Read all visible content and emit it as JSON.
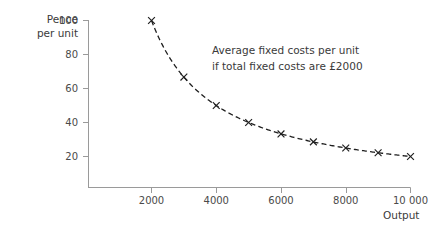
{
  "chart_data": {
    "type": "line",
    "title": "",
    "xlabel": "Output",
    "ylabel_line1": "Pence",
    "ylabel_line2": "per unit",
    "annotation_line1": "Average fixed costs per unit",
    "annotation_line2": "if total fixed costs are £2000",
    "xlim": [
      0,
      10800
    ],
    "ylim": [
      0,
      110
    ],
    "grid": false,
    "legend": "none",
    "line_style": "dashed",
    "marker": "x",
    "line_color": "#1f1f1f",
    "axis_color": "#9a9a9a",
    "text_color": "#3a3a3a",
    "xticks": [
      2000,
      4000,
      6000,
      8000,
      10000
    ],
    "xtick_labels": [
      "2000",
      "4000",
      "6000",
      "8000",
      "10 000"
    ],
    "yticks": [
      20,
      40,
      60,
      80,
      100
    ],
    "ytick_labels": [
      "20",
      "40",
      "60",
      "80",
      "100"
    ],
    "series": [
      {
        "name": "Average fixed cost per unit (pence)",
        "x": [
          2000,
          3000,
          4000,
          5000,
          6000,
          7000,
          8000,
          9000,
          10000
        ],
        "values": [
          100,
          66.7,
          50,
          40,
          33.3,
          28.6,
          25,
          22.2,
          20
        ]
      }
    ]
  }
}
